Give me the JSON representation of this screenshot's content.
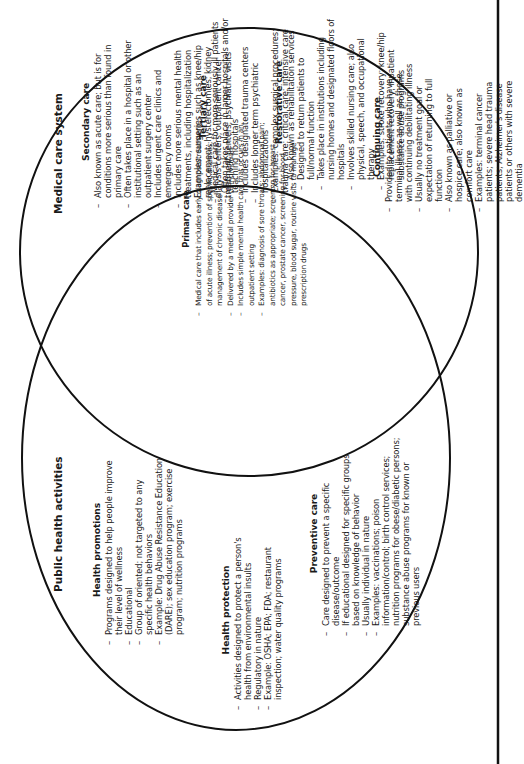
{
  "diagram": {
    "type": "venn",
    "orientation": "rotated-90-ccw",
    "colors": {
      "stroke": "#111111",
      "background": "#ffffff",
      "text": "#1a1a1a"
    },
    "medical_care_system": {
      "title": "Medical care system",
      "sections": [
        {
          "heading": "Secondary care",
          "items": [
            "Also known as acute care; but is for conditions more serious than found in primary care",
            "Often takes place in a hospital or other institutional setting such as an outpatient surgery center",
            "Includes urgent care clinics and emergency rooms",
            "Includes more serious mental health treatments, including hospitalization",
            "Examples: surgeries such as knee/hip replacement; hysterectomies; kidney dialysis centers; outpatient cancer treatment centers; psychiatric visits"
          ]
        },
        {
          "heading": "Tertiary care",
          "items": [
            "Medical care for more seriously ill patients",
            "Often takes place in larger hospitals and/or teaching hospitals",
            "Includes designated trauma centers",
            "Includes longer term psychiatric hospitalizations",
            "Examples: complex surgical procedures; trauma care; critical care; intensive care"
          ]
        },
        {
          "heading": "Restorative care",
          "items": [
            "Also known as rehabilitation services",
            "Designed to return patients to full/normal function",
            "Takes place in institutions including nursing homes and designated floors of hospitals",
            "Involves skilled nursing care; also physical, speech, and occupational therapy",
            "Examples: stroke recovery; knee/hip replacement recovery, inpatient substance abuse programs"
          ]
        },
        {
          "heading": "Continuing care",
          "items": [
            "Provided to patients who have terminal illness as well as those with continuing debilitating illness",
            "Usually no treatment goal or expectation of returning to full function",
            "Also known as palliative or hospice care; also known as comfort care",
            "Examples: terminal cancer patients; severe head trauma patients; Alzheimer's disease patients or others with severe dementia"
          ]
        }
      ]
    },
    "overlap": {
      "heading": "Primary care",
      "items": [
        "Medical care that includes early diagnosis/treatment of acute illness; prevention of specific diseases; management of chronic disease",
        "Delivered by a medical provider to individuals",
        "Includes simple mental health care that occurs in an outpatient setting",
        "Examples: diagnosis of sore throats; abdominal pain; antibiotics as appropriate; screening for breast cancer, prostate cancer, screening for blood pressure, blood sugar, routine visits to manage prescription drugs"
      ]
    },
    "public_health_activities": {
      "title": "Public health activities",
      "sections": [
        {
          "heading": "Health promotions",
          "items": [
            "Programs designed to help people improve their level of wellness",
            "Educational",
            "Group of oriented; not targeted to any specific health behaviors",
            "Example: Drug Abuse Resistance Education (DARE); sex education program; exercise program; nutrition programs"
          ]
        },
        {
          "heading": "Health protection",
          "items": [
            "Activities designed to protect a person's health from environmental insults",
            "Regulatory in nature",
            "Example: OSHA; EPA; FDA; restaurant inspection; water quality programs"
          ]
        },
        {
          "heading": "Preventive care",
          "items": [
            "Care designed to prevent a specific disease/outcome",
            "If educational designed for specific groups based on knowledge of behavior",
            "Usually individual in nature",
            "Examples: vaccinations; poison information/control; birth control services; nutrition programs for obese/diabetic persons; substance abuse programs for known or previous users"
          ]
        }
      ]
    }
  }
}
